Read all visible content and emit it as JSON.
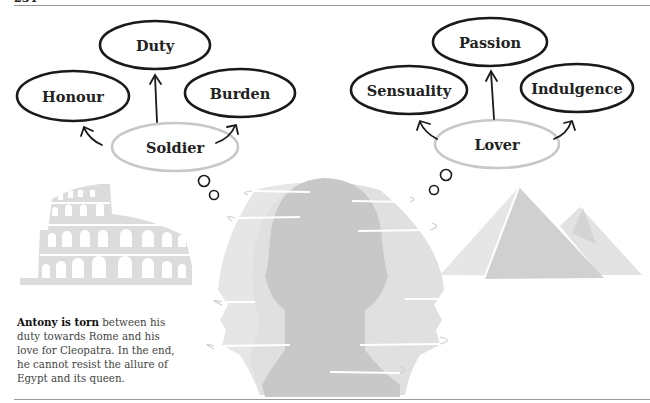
{
  "page": {
    "page_number": "234"
  },
  "diagram": {
    "left_group": {
      "center": "Soldier",
      "top": "Duty",
      "left": "Honour",
      "right": "Burden",
      "illustration": "colosseum"
    },
    "right_group": {
      "center": "Lover",
      "top": "Passion",
      "left": "Sensuality",
      "right": "Indulgence",
      "illustration": "pyramids"
    },
    "central_illustration": "three-overlapping-head-silhouettes"
  },
  "caption": {
    "bold": "Antony is torn",
    "text": " between his duty towards Rome and his love for Cleopatra. In the end, he cannot resist the allure of Egypt and its queen."
  },
  "colors": {
    "outline_dark": "#1a1a1a",
    "outline_light": "#c8c8c8",
    "silhouette_light": "#e4e4e4",
    "silhouette_mid": "#d6d6d6",
    "silhouette_dark": "#c4c4c4",
    "rule": "#9a9a9a"
  }
}
